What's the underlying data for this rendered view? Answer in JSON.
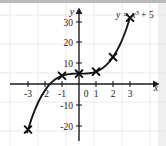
{
  "figure": {
    "equation_label": "y = x³ + 5",
    "equation_parts": {
      "lhs": "y",
      "equals": "=",
      "base": "x",
      "exponent": "3",
      "plus": "+",
      "constant": "5"
    },
    "x_axis_name": "x",
    "y_axis_name": "y",
    "colors": {
      "curve": "#161616",
      "axis": "#1a1a1a",
      "grid": "#e6e6e6",
      "marker": "#0d0d0d",
      "background": "#ffffff",
      "top_bar": "#b9b9b9",
      "right_strip": "#efefef"
    }
  },
  "chart_data": {
    "type": "line",
    "title": "",
    "subtitle": "",
    "annotations": [
      "y = x³ + 5"
    ],
    "xlabel": "x",
    "ylabel": "y",
    "xlim": [
      -3.6,
      3.9
    ],
    "ylim": [
      -25,
      36
    ],
    "xticks": [
      -3,
      -2,
      -1,
      0,
      1,
      2,
      3
    ],
    "yticks": [
      30,
      20,
      10,
      -10,
      -20
    ],
    "xtick_labels": [
      "-3",
      "-2",
      "-1",
      "0",
      "1",
      "2",
      "3"
    ],
    "ytick_labels": [
      "30",
      "20",
      "10",
      "-10",
      "-20"
    ],
    "grid": true,
    "legend": "none",
    "series": [
      {
        "name": "y = x³ + 5",
        "expression": "x^3 + 5",
        "marker": "x-cross",
        "x": [
          -3,
          -1,
          0,
          1,
          2,
          3
        ],
        "values": [
          -22,
          4,
          5,
          6,
          13,
          32
        ]
      }
    ],
    "curve_points": {
      "x": [
        -3.05,
        -2.8,
        -2.6,
        -2.4,
        -2.2,
        -2.0,
        -1.8,
        -1.6,
        -1.4,
        -1.2,
        -1.0,
        -0.8,
        -0.6,
        -0.4,
        -0.2,
        0.0,
        0.2,
        0.4,
        0.6,
        0.8,
        1.0,
        1.2,
        1.4,
        1.6,
        1.8,
        2.0,
        2.2,
        2.4,
        2.6,
        2.8,
        3.0
      ],
      "y": [
        -23.4,
        -16.95,
        -12.58,
        -8.82,
        -5.65,
        -3.0,
        -0.83,
        0.9,
        2.26,
        3.27,
        4.0,
        4.49,
        4.78,
        4.94,
        4.99,
        5.0,
        5.01,
        5.06,
        5.22,
        5.51,
        6.0,
        6.73,
        7.74,
        9.1,
        10.83,
        13.0,
        15.65,
        18.82,
        22.58,
        26.95,
        32.0
      ]
    }
  }
}
